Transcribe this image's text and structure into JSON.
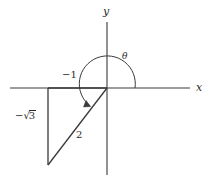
{
  "figure": {
    "background_color": "#ffffff",
    "line_color": "#3a3a3a",
    "text_color": "#2b2b2b",
    "axes": {
      "x_axis_label": "x",
      "y_axis_label": "y",
      "origin": {
        "x": 107,
        "y": 88
      },
      "x_axis_start": {
        "x": 10,
        "y": 88
      },
      "x_axis_end": {
        "x": 190,
        "y": 88
      },
      "y_axis_top": {
        "x": 107,
        "y": 22
      },
      "y_axis_bottom": {
        "x": 107,
        "y": 175
      }
    },
    "triangle": {
      "vertices": [
        {
          "name": "origin",
          "x": 107,
          "y": 88
        },
        {
          "name": "adjacent-corner",
          "x": 48,
          "y": 88
        },
        {
          "name": "terminal-point",
          "x": 48,
          "y": 165
        }
      ],
      "adjacent_label": "−1",
      "opposite_label": "−√3",
      "opposite_label_prefix": "−√",
      "opposite_label_radicand": "3",
      "hypotenuse_label": "2"
    },
    "angle": {
      "symbol": "θ",
      "arc_radius": 28,
      "arc_start_deg": 0,
      "arc_end_deg": 232,
      "direction": "counterclockwise"
    },
    "labels": {
      "x": "x",
      "y": "y",
      "theta": "θ",
      "minus_one": "−1",
      "two": "2",
      "minus_sqrt_three_prefix": "−√",
      "minus_sqrt_three_radicand": "3"
    }
  }
}
